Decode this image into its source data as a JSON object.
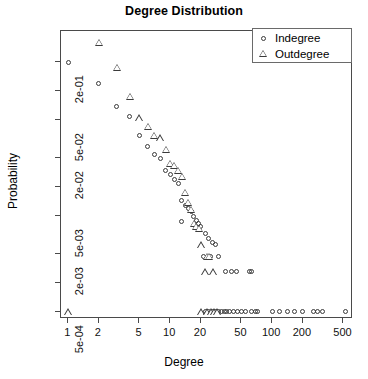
{
  "chart_data": {
    "type": "scatter",
    "title": "Degree Distribution",
    "xlabel": "Degree",
    "ylabel": "Probability",
    "xscale": "log",
    "yscale": "log",
    "xlim": [
      0.85,
      620
    ],
    "ylim": [
      0.00042,
      0.42
    ],
    "grid": false,
    "legend_position": "top-right",
    "xticks": [
      1,
      2,
      5,
      10,
      20,
      50,
      100,
      200,
      500
    ],
    "xtick_labels": [
      "1",
      "2",
      "5",
      "10",
      "20",
      "50",
      "100",
      "200",
      "500"
    ],
    "yticks": [
      0.2,
      0.1,
      0.05,
      0.02,
      0.01,
      0.005,
      0.002,
      0.001,
      0.0005
    ],
    "ytick_labels": [
      "2e-01",
      "",
      "5e-02",
      "2e-02",
      "",
      "5e-03",
      "2e-03",
      "",
      "5e-04"
    ],
    "series": [
      {
        "name": "Indegree",
        "marker": "circle",
        "color": "#3a3a3a",
        "points": [
          [
            1,
            0.196
          ],
          [
            2,
            0.118
          ],
          [
            3,
            0.068
          ],
          [
            4,
            0.0545
          ],
          [
            5,
            0.0345
          ],
          [
            6,
            0.0265
          ],
          [
            7,
            0.0218
          ],
          [
            8,
            0.0196
          ],
          [
            9,
            0.0147
          ],
          [
            10,
            0.0133
          ],
          [
            11,
            0.0118
          ],
          [
            12,
            0.0108
          ],
          [
            13,
            0.0072
          ],
          [
            14,
            0.0064
          ],
          [
            15,
            0.0059
          ],
          [
            16,
            0.0056
          ],
          [
            17,
            0.0049
          ],
          [
            18,
            0.0045
          ],
          [
            19,
            0.0042
          ],
          [
            20,
            0.0039
          ],
          [
            13,
            0.0044
          ],
          [
            22,
            0.0033
          ],
          [
            24,
            0.0029
          ],
          [
            26,
            0.0026
          ],
          [
            28,
            0.0025
          ],
          [
            21,
            0.0019
          ],
          [
            25,
            0.0019
          ],
          [
            30,
            0.0019
          ],
          [
            35,
            0.0013
          ],
          [
            40,
            0.0013
          ],
          [
            45,
            0.0013
          ],
          [
            60,
            0.0013
          ],
          [
            62,
            0.0013
          ],
          [
            22,
            0.0005
          ],
          [
            24,
            0.0005
          ],
          [
            26,
            0.0005
          ],
          [
            28,
            0.0005
          ],
          [
            30,
            0.0005
          ],
          [
            32,
            0.0005
          ],
          [
            34,
            0.0005
          ],
          [
            36,
            0.0005
          ],
          [
            38,
            0.0005
          ],
          [
            42,
            0.0005
          ],
          [
            46,
            0.0005
          ],
          [
            50,
            0.0005
          ],
          [
            55,
            0.0005
          ],
          [
            62,
            0.0005
          ],
          [
            68,
            0.0005
          ],
          [
            72,
            0.0005
          ],
          [
            100,
            0.0005
          ],
          [
            118,
            0.0005
          ],
          [
            140,
            0.0005
          ],
          [
            165,
            0.0005
          ],
          [
            200,
            0.0005
          ],
          [
            255,
            0.0005
          ],
          [
            280,
            0.0005
          ],
          [
            310,
            0.0005
          ],
          [
            520,
            0.0005
          ]
        ]
      },
      {
        "name": "Outdegree",
        "marker": "triangle",
        "color": "#3a3a3a",
        "points": [
          [
            2,
            0.32
          ],
          [
            3,
            0.175
          ],
          [
            4,
            0.088
          ],
          [
            5,
            0.0525
          ],
          [
            6,
            0.0425
          ],
          [
            7,
            0.0345
          ],
          [
            8,
            0.0325
          ],
          [
            9,
            0.0245
          ],
          [
            10,
            0.0175
          ],
          [
            11,
            0.0168
          ],
          [
            12,
            0.0148
          ],
          [
            13,
            0.0128
          ],
          [
            14,
            0.0088
          ],
          [
            15,
            0.0069
          ],
          [
            16,
            0.0058
          ],
          [
            17,
            0.0042
          ],
          [
            18,
            0.0039
          ],
          [
            19,
            0.0037
          ],
          [
            20,
            0.0025
          ],
          [
            23,
            0.0019
          ],
          [
            24,
            0.0019
          ],
          [
            22,
            0.0013
          ],
          [
            26,
            0.0013
          ],
          [
            1,
            0.0005
          ],
          [
            20,
            0.0005
          ],
          [
            23,
            0.0005
          ],
          [
            25,
            0.0005
          ],
          [
            27,
            0.0005
          ],
          [
            29,
            0.0005
          ]
        ]
      }
    ]
  },
  "legend": {
    "entries": [
      {
        "label": "Indegree",
        "marker": "circle-icon"
      },
      {
        "label": "Outdegree",
        "marker": "triangle-icon"
      }
    ]
  }
}
